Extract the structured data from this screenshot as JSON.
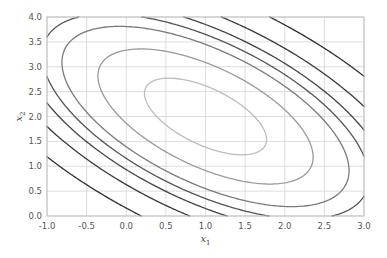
{
  "chart_data": {
    "type": "contour",
    "title": "",
    "xlabel": "x",
    "xlabel_sub": "1",
    "ylabel": "x",
    "ylabel_sub": "2",
    "xlim": [
      -1.0,
      3.0
    ],
    "ylim": [
      0.0,
      4.0
    ],
    "xticks": [
      "-1.0",
      "-0.5",
      "0.0",
      "0.5",
      "1.0",
      "1.5",
      "2.0",
      "2.5",
      "3.0"
    ],
    "yticks": [
      "0.0",
      "0.5",
      "1.0",
      "1.5",
      "2.0",
      "2.5",
      "3.0",
      "3.5",
      "4.0"
    ],
    "grid": true,
    "legend": null,
    "function": {
      "form": "a*(x1-c1)^2 + 2*b*(x1-c1)*(x2-c2) + d*(x2-c2)^2",
      "center": [
        1.0,
        2.0
      ],
      "a": 1.0,
      "b": 0.6,
      "d": 1.0
    },
    "levels": [
      0.38,
      1.18,
      2.1,
      2.72,
      3.42,
      4.52,
      6.6
    ],
    "level_colors": [
      "#bdbdbd",
      "#9a9a9a",
      "#7a7a7a",
      "#555555",
      "#444444",
      "#393939",
      "#2e2e2e"
    ],
    "grid_color": "#d4d4d4",
    "axis_color": "#bfbfbf"
  },
  "plot_box": {
    "left": 47,
    "top": 17,
    "right": 364,
    "bottom": 216
  }
}
